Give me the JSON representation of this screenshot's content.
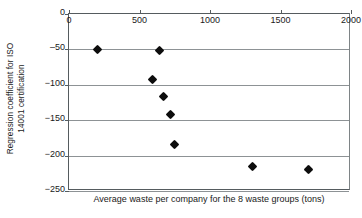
{
  "chart_data": {
    "type": "scatter",
    "title": "",
    "xlabel": "Average waste per company for the 8 waste groups (tons)",
    "ylabel_lines": [
      "Regression coefficient for ISO",
      "14001 certification"
    ],
    "ylabel": "Regression coefficient for ISO 14001 certification",
    "xlim": [
      0,
      2000
    ],
    "ylim": [
      -250,
      0
    ],
    "xticks": [
      0,
      500,
      1000,
      1500,
      2000
    ],
    "xtick_labels": [
      "0",
      "500",
      "1000",
      "1500",
      "2000"
    ],
    "yticks": [
      0,
      -50,
      -100,
      -150,
      -200,
      -250
    ],
    "ytick_labels": [
      "0",
      "‒50",
      "−100",
      "−150",
      "−200",
      "−250"
    ],
    "grid": "horizontal",
    "x_axis_position": "top",
    "legend": "none",
    "marker": "diamond",
    "marker_color": "#0d0d0d",
    "points": [
      {
        "x": 200,
        "y": -50
      },
      {
        "x": 640,
        "y": -52
      },
      {
        "x": 590,
        "y": -93
      },
      {
        "x": 670,
        "y": -116
      },
      {
        "x": 720,
        "y": -142
      },
      {
        "x": 750,
        "y": -184
      },
      {
        "x": 1300,
        "y": -216
      },
      {
        "x": 1700,
        "y": -219
      }
    ],
    "n_points": 8,
    "axis_color": "#555b5e",
    "grid_color": "#8d9295",
    "background_color": "#ffffff"
  }
}
